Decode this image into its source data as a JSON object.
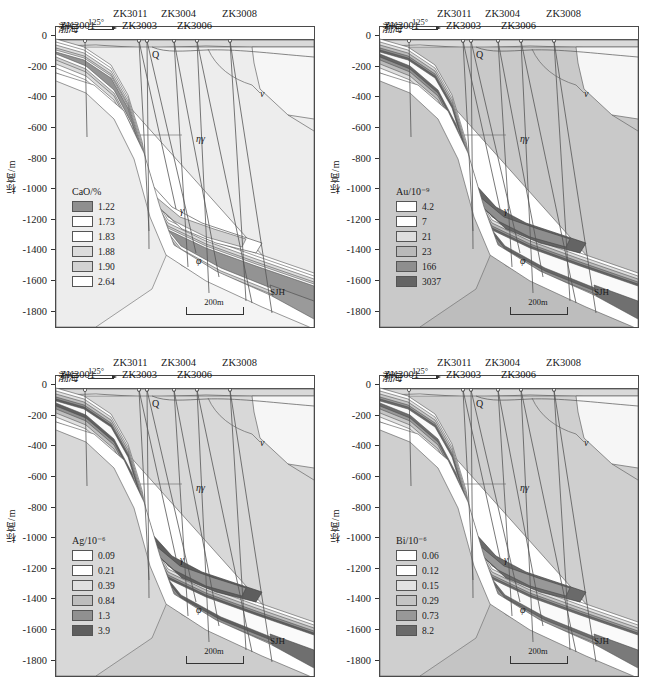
{
  "figure": {
    "type": "geological-cross-section-grid",
    "panel_count": 4,
    "axis": {
      "y_label": "标高/m",
      "y_ticks": [
        "0",
        "-200",
        "-400",
        "-600",
        "-800",
        "-1000",
        "-1200",
        "-1400",
        "-1600",
        "-1800"
      ],
      "y_values": [
        0,
        -200,
        -400,
        -600,
        -800,
        -1000,
        -1200,
        -1400,
        -1600,
        -1800
      ],
      "y_min": -1900,
      "y_max": 60
    },
    "annotations": {
      "sea_label": "渤海",
      "azimuth": "125°",
      "scale_label": "200m",
      "boreholes": [
        "ZK3001",
        "ZK3011",
        "ZK3003",
        "ZK3004",
        "ZK3006",
        "ZK3008"
      ],
      "units": [
        {
          "symbol": "Q",
          "name": "quaternary"
        },
        {
          "symbol": "ν",
          "name": "mafic-dike"
        },
        {
          "symbol": "ηγ",
          "name": "monzogranite"
        },
        {
          "symbol": "γ",
          "name": "granite"
        },
        {
          "symbol": "φ",
          "name": "lamprophyre"
        },
        {
          "symbol": "SJH",
          "name": "sanshandao-fault"
        }
      ]
    }
  },
  "chart_data": [
    {
      "type": "heatmap",
      "title": "CaO/%",
      "element": "CaO",
      "unit": "%",
      "panel": "top-left",
      "legend_position": "inside-left",
      "xlabel": "",
      "ylabel": "标高/m",
      "ylim": [
        -1900,
        60
      ],
      "categories": [
        "1.22",
        "1.73",
        "1.83",
        "1.88",
        "1.90",
        "2.64"
      ],
      "values": [
        1.22,
        1.73,
        1.83,
        1.88,
        1.9,
        2.64
      ],
      "colors": [
        "#8f8f8f",
        "#ffffff",
        "#ffffff",
        "#dcdcdc",
        "#d2d2d2",
        "#ffffff"
      ]
    },
    {
      "type": "heatmap",
      "title": "Au/10⁻⁹",
      "element": "Au",
      "unit": "10-9",
      "panel": "top-right",
      "legend_position": "inside-left",
      "xlabel": "",
      "ylabel": "标高/m",
      "ylim": [
        -1900,
        60
      ],
      "categories": [
        "4.2",
        "7",
        "21",
        "23",
        "166",
        "3037"
      ],
      "values": [
        4.2,
        7,
        21,
        23,
        166,
        3037
      ],
      "colors": [
        "#ffffff",
        "#ffffff",
        "#dedede",
        "#b9b9b9",
        "#8e8e8e",
        "#646464"
      ]
    },
    {
      "type": "heatmap",
      "title": "Ag/10⁻⁶",
      "element": "Ag",
      "unit": "10-6",
      "panel": "bottom-left",
      "legend_position": "inside-left",
      "xlabel": "",
      "ylabel": "标高/m",
      "ylim": [
        -1900,
        60
      ],
      "categories": [
        "0.09",
        "0.21",
        "0.39",
        "0.84",
        "1.3",
        "3.9"
      ],
      "values": [
        0.09,
        0.21,
        0.39,
        0.84,
        1.3,
        3.9
      ],
      "colors": [
        "#ffffff",
        "#ffffff",
        "#e0e0e0",
        "#bdbdbd",
        "#909090",
        "#5e5e5e"
      ]
    },
    {
      "type": "heatmap",
      "title": "Bi/10⁻⁶",
      "element": "Bi",
      "unit": "10-6",
      "panel": "bottom-right",
      "legend_position": "inside-left",
      "xlabel": "",
      "ylabel": "标高/m",
      "ylim": [
        -1900,
        60
      ],
      "categories": [
        "0.06",
        "0.12",
        "0.15",
        "0.29",
        "0.73",
        "8.2"
      ],
      "values": [
        0.06,
        0.12,
        0.15,
        0.29,
        0.73,
        8.2
      ],
      "colors": [
        "#ffffff",
        "#ffffff",
        "#e2e2e2",
        "#c4c4c4",
        "#989898",
        "#6a6a6a"
      ]
    }
  ]
}
